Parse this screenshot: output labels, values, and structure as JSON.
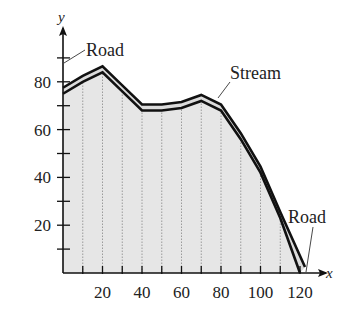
{
  "chart_data": {
    "type": "area",
    "title": "",
    "xlabel": "x",
    "ylabel": "y",
    "xlim": [
      0,
      125
    ],
    "ylim": [
      0,
      95
    ],
    "x_ticks": [
      10,
      20,
      30,
      40,
      50,
      60,
      70,
      80,
      90,
      100,
      110,
      120
    ],
    "x_tick_labels": [
      "20",
      "40",
      "60",
      "80",
      "100",
      "120"
    ],
    "x_tick_label_values": [
      20,
      40,
      60,
      80,
      100,
      120
    ],
    "y_ticks": [
      10,
      20,
      30,
      40,
      50,
      60,
      70,
      80,
      90
    ],
    "y_tick_labels": [
      "20",
      "40",
      "60",
      "80"
    ],
    "y_tick_label_values": [
      20,
      40,
      60,
      80
    ],
    "grid": "vertical dotted lines every 10 units",
    "series": [
      {
        "name": "Stream",
        "x": [
          0,
          10,
          20,
          30,
          40,
          50,
          60,
          70,
          80,
          90,
          100,
          110,
          120
        ],
        "y": [
          75,
          80,
          84,
          76,
          68,
          68,
          69,
          72,
          68,
          56,
          42,
          23,
          0
        ]
      }
    ],
    "annotations": [
      {
        "text": "Road",
        "target": "y-axis",
        "position": "top-left"
      },
      {
        "text": "Stream",
        "target": "curve near x=75",
        "position": "top-right"
      },
      {
        "text": "Road",
        "target": "x-axis",
        "position": "bottom-right"
      }
    ],
    "fill": "light gray stipple under curve"
  },
  "labels": {
    "road_top": "Road",
    "stream": "Stream",
    "road_bottom": "Road",
    "x_axis": "x",
    "y_axis": "y"
  },
  "colors": {
    "fill": "#e6e6e6",
    "line": "#111111",
    "grid": "#888888"
  }
}
